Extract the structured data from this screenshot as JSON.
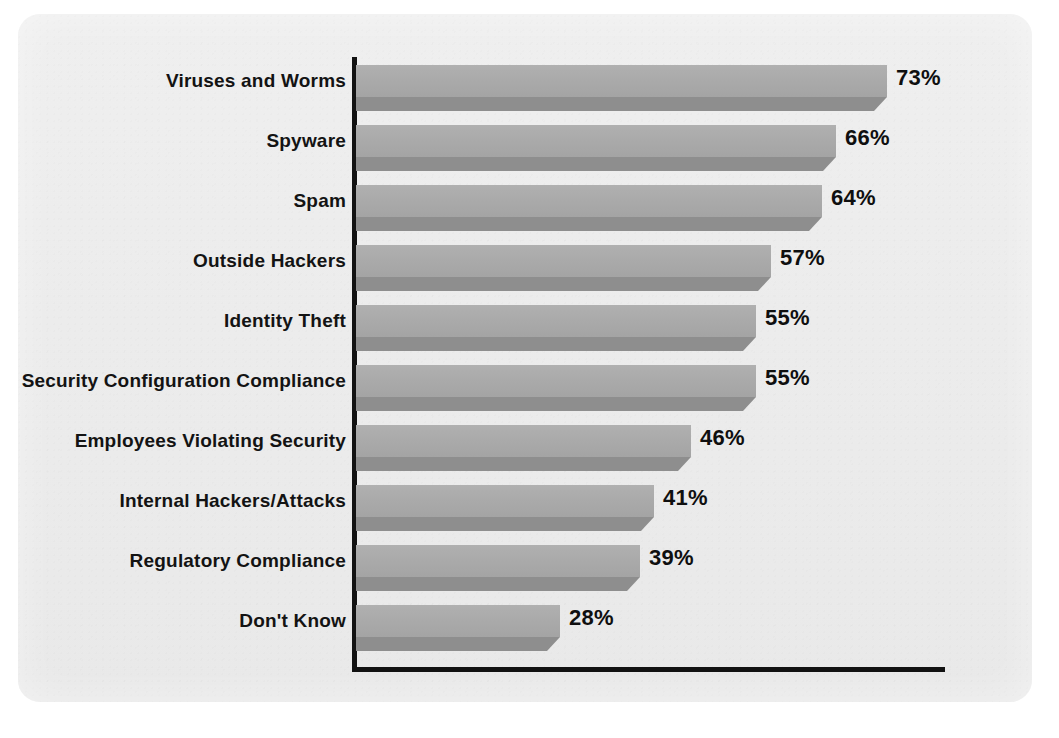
{
  "chart_data": {
    "type": "bar",
    "orientation": "horizontal",
    "title": "",
    "subtitle": "",
    "xlabel": "",
    "ylabel": "",
    "xlim": [
      0,
      85
    ],
    "grid": false,
    "legend": null,
    "value_suffix": "%",
    "categories": [
      "Viruses and Worms",
      "Spyware",
      "Spam",
      "Outside Hackers",
      "Identity Theft",
      "Security Configuration Compliance",
      "Employees Violating Security",
      "Internal Hackers/Attacks",
      "Regulatory Compliance",
      "Don't Know"
    ],
    "values": [
      73,
      66,
      64,
      57,
      55,
      55,
      46,
      41,
      39,
      28
    ],
    "value_labels": [
      "73%",
      "66%",
      "64%",
      "57%",
      "55%",
      "55%",
      "46%",
      "41%",
      "39%",
      "28%"
    ],
    "series": [
      {
        "name": "",
        "values": [
          73,
          66,
          64,
          57,
          55,
          55,
          46,
          41,
          39,
          28
        ]
      }
    ],
    "colors": {
      "bar_face": "#a9a9a9",
      "bar_shadow": "#8e8e8e",
      "axis": "#121212",
      "panel_background": "#ececec",
      "page_background": "#ffffff",
      "label_text": "#131313",
      "value_text": "#0f0f0f"
    }
  }
}
